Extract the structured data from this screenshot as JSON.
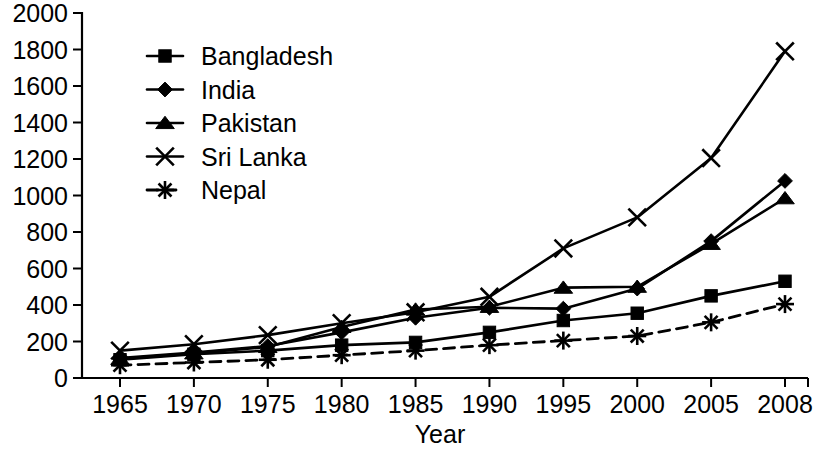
{
  "chart_data": {
    "type": "line",
    "title": "",
    "xlabel": "Year",
    "ylabel": "",
    "grid": false,
    "legend_position": "top-left",
    "categories": [
      "1965",
      "1970",
      "1975",
      "1980",
      "1985",
      "1990",
      "1995",
      "2000",
      "2005",
      "2008"
    ],
    "x": [
      1965,
      1970,
      1975,
      1980,
      1985,
      1990,
      1995,
      2000,
      2005,
      2008
    ],
    "xlim": [
      1965,
      2008
    ],
    "ylim": [
      0,
      2000
    ],
    "ytick_labels": [
      "0",
      "200",
      "400",
      "600",
      "800",
      "1000",
      "1200",
      "1400",
      "1600",
      "1800",
      "2000"
    ],
    "yticks": [
      0,
      200,
      400,
      600,
      800,
      1000,
      1200,
      1400,
      1600,
      1800,
      2000
    ],
    "xtick_labels": [
      "1965",
      "1970",
      "1975",
      "1980",
      "1985",
      "1990",
      "1995",
      "2000",
      "2005",
      "2008"
    ],
    "series": [
      {
        "name": "Bangladesh",
        "marker": "square",
        "line_style": "solid",
        "color": "#000000",
        "values": [
          100,
          130,
          150,
          180,
          195,
          250,
          315,
          355,
          450,
          530
        ]
      },
      {
        "name": "India",
        "marker": "diamond",
        "line_style": "solid",
        "color": "#000000",
        "values": [
          110,
          140,
          175,
          250,
          330,
          385,
          380,
          490,
          750,
          1080
        ]
      },
      {
        "name": "Pakistan",
        "marker": "triangle",
        "line_style": "solid",
        "color": "#000000",
        "values": [
          105,
          135,
          170,
          280,
          375,
          390,
          495,
          500,
          735,
          985
        ]
      },
      {
        "name": "Sri Lanka",
        "marker": "cross",
        "line_style": "solid",
        "color": "#000000",
        "values": [
          150,
          185,
          235,
          300,
          360,
          445,
          710,
          880,
          1205,
          1790
        ]
      },
      {
        "name": "Nepal",
        "marker": "asterisk",
        "line_style": "dashed",
        "color": "#000000",
        "values": [
          70,
          85,
          100,
          125,
          150,
          180,
          205,
          230,
          305,
          405
        ]
      }
    ]
  },
  "legend": {
    "items": [
      {
        "label": "Bangladesh"
      },
      {
        "label": "India"
      },
      {
        "label": "Pakistan"
      },
      {
        "label": "Sri Lanka"
      },
      {
        "label": "Nepal"
      }
    ]
  },
  "axes": {
    "x_title": "Year"
  }
}
